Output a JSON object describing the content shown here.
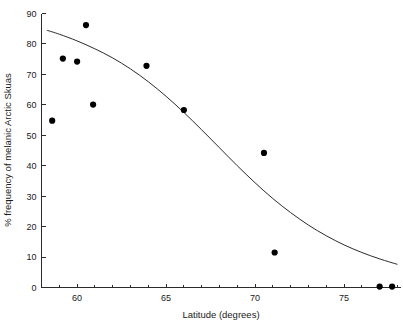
{
  "chart_data": {
    "type": "scatter",
    "title": "",
    "xlabel": "Latitude (degrees)",
    "ylabel": "% frequency of melanic Arctic Skuas",
    "xlim": [
      58.0,
      78.2
    ],
    "ylim": [
      0,
      90
    ],
    "xticks": [
      60,
      65,
      70,
      75
    ],
    "xticklabels": [
      "60",
      "65",
      "70",
      "75"
    ],
    "xminorticks": [
      59,
      61,
      62,
      63,
      64,
      66,
      67,
      68,
      69,
      71,
      72,
      73,
      74,
      76,
      77,
      78
    ],
    "yticks": [
      0,
      10,
      20,
      30,
      40,
      50,
      60,
      70,
      80,
      90
    ],
    "yticklabels": [
      "0",
      "10",
      "20",
      "30",
      "40",
      "50",
      "60",
      "70",
      "80",
      "90"
    ],
    "grid": false,
    "legend": false,
    "marker": "filled-circle",
    "marker_color": "#000000",
    "curve_color": "#2b2b2b",
    "points": [
      {
        "x": 58.6,
        "y": 54.8
      },
      {
        "x": 59.2,
        "y": 75.2
      },
      {
        "x": 60.0,
        "y": 74.2
      },
      {
        "x": 60.5,
        "y": 86.2
      },
      {
        "x": 60.9,
        "y": 60.1
      },
      {
        "x": 63.9,
        "y": 72.8
      },
      {
        "x": 66.0,
        "y": 58.3
      },
      {
        "x": 70.5,
        "y": 44.2
      },
      {
        "x": 71.1,
        "y": 11.5
      },
      {
        "x": 77.0,
        "y": 0.3
      },
      {
        "x": 77.7,
        "y": 0.3
      }
    ],
    "curve": [
      {
        "x": 58.3,
        "y": 84.5
      },
      {
        "x": 59.0,
        "y": 83.2
      },
      {
        "x": 60.0,
        "y": 81.0
      },
      {
        "x": 61.0,
        "y": 78.4
      },
      {
        "x": 62.0,
        "y": 75.4
      },
      {
        "x": 63.0,
        "y": 71.8
      },
      {
        "x": 64.0,
        "y": 67.6
      },
      {
        "x": 65.0,
        "y": 62.8
      },
      {
        "x": 66.0,
        "y": 57.5
      },
      {
        "x": 67.0,
        "y": 51.8
      },
      {
        "x": 68.0,
        "y": 45.9
      },
      {
        "x": 69.0,
        "y": 40.0
      },
      {
        "x": 70.0,
        "y": 34.4
      },
      {
        "x": 71.0,
        "y": 29.2
      },
      {
        "x": 72.0,
        "y": 24.6
      },
      {
        "x": 73.0,
        "y": 20.5
      },
      {
        "x": 74.0,
        "y": 17.0
      },
      {
        "x": 75.0,
        "y": 14.0
      },
      {
        "x": 76.0,
        "y": 11.5
      },
      {
        "x": 77.0,
        "y": 9.4
      },
      {
        "x": 78.0,
        "y": 7.6
      }
    ]
  }
}
